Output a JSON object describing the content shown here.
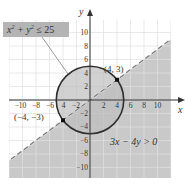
{
  "chart_data": {
    "type": "region",
    "title": "",
    "xlabel": "x",
    "ylabel": "y",
    "xlim": [
      -12,
      12
    ],
    "ylim": [
      -12,
      12
    ],
    "grid": true,
    "x_ticks": [
      -10,
      -8,
      -6,
      -4,
      -2,
      2,
      4,
      6,
      8,
      10
    ],
    "y_ticks": [
      10,
      8,
      6,
      4,
      2,
      -2,
      -4,
      -6,
      -8,
      -10
    ],
    "x_tick_labels": [
      "−10",
      "−8",
      "−6",
      "−4",
      "−2",
      "2",
      "4",
      "6",
      "8",
      "10"
    ],
    "y_tick_labels": [
      "10",
      "8",
      "6",
      "4",
      "2",
      "−2",
      "−4",
      "−6",
      "−8",
      "−10"
    ],
    "circle": {
      "center": [
        0,
        0
      ],
      "radius": 5,
      "style": "solid",
      "inequality": "x² + y² ≤ 25"
    },
    "line": {
      "equation": "3x − 4y = 0",
      "slope": 0.75,
      "style": "dashed",
      "inequality": "3x − 4y > 0",
      "shaded_side": "below"
    },
    "points": [
      {
        "x": 4,
        "y": 3,
        "label": "(4, 3)"
      },
      {
        "x": -4,
        "y": -3,
        "label": "(−4, −3)"
      }
    ],
    "annotations": [
      {
        "text": "x² + y² ≤ 25",
        "position": "upper-left",
        "boxed": true
      },
      {
        "text": "3x − 4y > 0",
        "position": "lower-right"
      }
    ]
  },
  "labels": {
    "x_axis": "x",
    "y_axis": "y",
    "circle_box": "x² + y² ≤ 25",
    "line_ineq": "3x − 4y > 0",
    "point1": "(4, 3)",
    "point2": "(−4, −3)",
    "xt": [
      "−10",
      "−8",
      "−6",
      "4",
      "−2",
      "2",
      "4",
      "6",
      "8",
      "10"
    ],
    "yt": [
      "10",
      "8",
      "6",
      "4",
      "2",
      "−2",
      "−4",
      "−6",
      "−8",
      "−10"
    ]
  },
  "colors": {
    "shade": "#c8c8c8",
    "circle_fill": "#b9b9b9",
    "grid": "#e2e2e2",
    "grid_shaded": "#d6d6d6",
    "axis": "#333333",
    "dash": "#888888"
  }
}
